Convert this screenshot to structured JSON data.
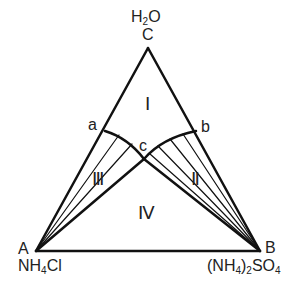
{
  "diagram": {
    "type": "ternary-phase-diagram",
    "vertices": {
      "top": {
        "letter": "C",
        "formula_parts": [
          "H",
          "2",
          "O"
        ]
      },
      "left": {
        "letter": "A",
        "formula_parts": [
          "NH",
          "4",
          "Cl"
        ]
      },
      "right": {
        "letter": "B",
        "formula_parts": [
          "(NH",
          "4",
          ")",
          "2",
          "SO",
          "4"
        ]
      }
    },
    "points": {
      "a": "a",
      "b": "b",
      "c": "c"
    },
    "regions": {
      "I": "Ⅰ",
      "II": "Ⅱ",
      "III": "Ⅲ",
      "IV": "Ⅳ"
    },
    "line_color": "#111111"
  }
}
